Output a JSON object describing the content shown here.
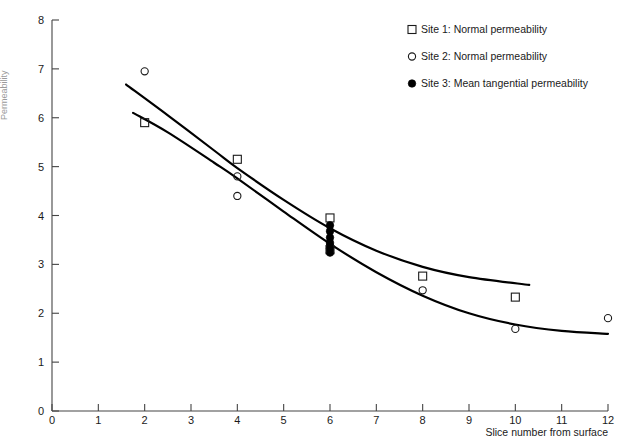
{
  "chart_data": {
    "type": "scatter",
    "title": "",
    "xlabel": "Slice number from surface",
    "ylabel": "Permeability",
    "xlim": [
      0,
      12
    ],
    "ylim": [
      0,
      8
    ],
    "xticks": [
      "0",
      "1",
      "2",
      "3",
      "4",
      "5",
      "6",
      "7",
      "8",
      "9",
      "10",
      "11",
      "12"
    ],
    "yticks": [
      "0",
      "1",
      "2",
      "3",
      "4",
      "5",
      "6",
      "7",
      "8"
    ],
    "grid": false,
    "legend_position": "top-right",
    "series": [
      {
        "name": "Site 1: Normal permeability",
        "marker": "open-square",
        "points": [
          {
            "x": 2,
            "y": 5.9
          },
          {
            "x": 4,
            "y": 5.15
          },
          {
            "x": 6,
            "y": 3.95
          },
          {
            "x": 6,
            "y": 3.3
          },
          {
            "x": 8,
            "y": 2.76
          },
          {
            "x": 10,
            "y": 2.33
          }
        ]
      },
      {
        "name": "Site 2: Normal permeability",
        "marker": "open-circle",
        "points": [
          {
            "x": 2,
            "y": 6.95
          },
          {
            "x": 4,
            "y": 4.8
          },
          {
            "x": 4,
            "y": 4.4
          },
          {
            "x": 6,
            "y": 3.38
          },
          {
            "x": 8,
            "y": 2.47
          },
          {
            "x": 10,
            "y": 1.68
          },
          {
            "x": 12,
            "y": 1.9
          }
        ]
      },
      {
        "name": "Site 3: Mean tangential permeability",
        "marker": "filled-circle",
        "points": [
          {
            "x": 6,
            "y": 3.8
          },
          {
            "x": 6,
            "y": 3.68
          },
          {
            "x": 6,
            "y": 3.55
          },
          {
            "x": 6,
            "y": 3.44
          },
          {
            "x": 6,
            "y": 3.32
          },
          {
            "x": 6,
            "y": 3.24
          }
        ]
      }
    ],
    "fit_curves": [
      {
        "name": "upper-fit-curve",
        "comment": "Site 1 trend, flattening near 2.6",
        "points": [
          {
            "x": 1.6,
            "y": 6.68
          },
          {
            "x": 2.5,
            "y": 6.05
          },
          {
            "x": 3.5,
            "y": 5.33
          },
          {
            "x": 4.0,
            "y": 4.97
          },
          {
            "x": 5.0,
            "y": 4.32
          },
          {
            "x": 6.0,
            "y": 3.74
          },
          {
            "x": 7.0,
            "y": 3.28
          },
          {
            "x": 8.0,
            "y": 2.95
          },
          {
            "x": 9.0,
            "y": 2.74
          },
          {
            "x": 10.3,
            "y": 2.58
          }
        ]
      },
      {
        "name": "lower-fit-curve",
        "comment": "Site 2 trend, flattening near 1.6",
        "points": [
          {
            "x": 1.75,
            "y": 6.1
          },
          {
            "x": 2.5,
            "y": 5.7
          },
          {
            "x": 3.5,
            "y": 5.08
          },
          {
            "x": 4.0,
            "y": 4.76
          },
          {
            "x": 5.0,
            "y": 4.08
          },
          {
            "x": 6.0,
            "y": 3.42
          },
          {
            "x": 7.0,
            "y": 2.84
          },
          {
            "x": 8.0,
            "y": 2.36
          },
          {
            "x": 9.0,
            "y": 2.0
          },
          {
            "x": 10.0,
            "y": 1.77
          },
          {
            "x": 11.0,
            "y": 1.64
          },
          {
            "x": 12.0,
            "y": 1.58
          }
        ]
      }
    ]
  },
  "legend": {
    "items": [
      {
        "marker": "open-square",
        "label": "Site 1: Normal permeability"
      },
      {
        "marker": "open-circle",
        "label": "Site 2: Normal permeability"
      },
      {
        "marker": "filled-circle",
        "label": "Site 3: Mean tangential permeability"
      }
    ]
  },
  "axes": {
    "x_title": "Slice number from surface",
    "y_title": "Permeability"
  },
  "colors": {
    "curve": "#000000",
    "axis": "#444444",
    "text": "#1a1a1a"
  }
}
